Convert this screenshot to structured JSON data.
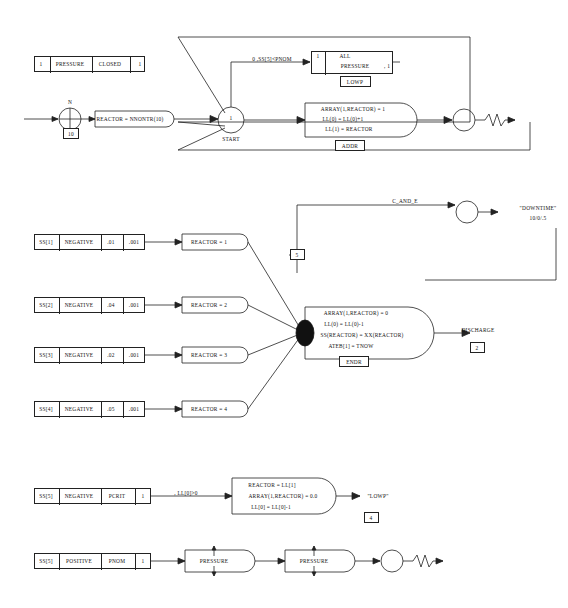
{
  "diagram": {
    "nodes": {
      "pressure_closed": {
        "cells": [
          "1",
          "PRESSURE",
          "CLOSED",
          "1"
        ]
      },
      "ss5_pnom_label": "0 ,SS[5]<PNOM",
      "all_pressure": {
        "cells": [
          "1",
          "ALL",
          "PRESSURE",
          ", 1"
        ],
        "tag": "LOWP"
      },
      "reactor_nnontr": "REACTOR = NNONTR(10)",
      "start_token": "1",
      "start_label": "START",
      "input_n": "N",
      "input_10": "10",
      "array_block1": [
        "ARRAY(1,REACTOR) = 1",
        "LL(0) = LL(0)+1",
        "LL(1) = REACTOR"
      ],
      "array_block1_tag": "ADDR",
      "c_and_e": "C_AND_E",
      "tnow_ateb": "TNOW-ATEB[1]",
      "downtime": "\"DOWNTIME\"",
      "downtime_fmt": "10/0/.5",
      "downtime_count": "5",
      "ss1_row": {
        "cells": [
          "SS[1]",
          "NEGATIVE",
          ".01",
          ".001"
        ],
        "out": "REACTOR = 1"
      },
      "ss2_row": {
        "cells": [
          "SS[2]",
          "NEGATIVE",
          ".04",
          ".001"
        ],
        "out": "REACTOR = 2"
      },
      "ss3_row": {
        "cells": [
          "SS[3]",
          "NEGATIVE",
          ".02",
          ".001"
        ],
        "out": "REACTOR = 3"
      },
      "ss4_row": {
        "cells": [
          "SS[4]",
          "NEGATIVE",
          ".05",
          ".001"
        ],
        "out": "REACTOR = 4"
      },
      "array_block2": [
        "ARRAY(1,REACTOR) = 0",
        "LL(0) = LL(0)-1",
        "SS(REACTOR) = XX(REACTOR)",
        "ATEB[1] = TNOW"
      ],
      "array_block2_tag": "ENDR",
      "discharge": "DISCHARGE",
      "discharge_count": "2",
      "ss5_row": {
        "cells": [
          "SS[5]",
          "NEGATIVE",
          "PCRIT",
          "1"
        ],
        "cond": ", LL[0]>0"
      },
      "block3": [
        "REACTOR = LL[1]",
        "ARRAY(1,REACTOR) = 0.0",
        "LL[0] = LL[0]-1"
      ],
      "lowp_out": "\"LOWP\"",
      "lowp_count": "4",
      "ss6_row": {
        "cells": [
          "SS[5]",
          "POSITIVE",
          "PNOM",
          "1"
        ]
      },
      "pressure_a": "PRESSURE",
      "pressure_b": "PRESSURE"
    }
  }
}
